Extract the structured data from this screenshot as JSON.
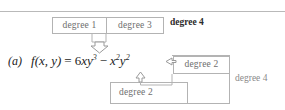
{
  "figure": {
    "label": "(a)",
    "formula": {
      "function_name": "f",
      "args": "(x, y)",
      "equals": "=",
      "term1_coeff": "6",
      "term1_var_x": "x",
      "term1_var_y": "y",
      "term1_y_exp": "3",
      "operator": "−",
      "term2_var_x": "x",
      "term2_x_exp": "2",
      "term2_var_y": "y",
      "term2_y_exp": "2",
      "plain_text": "f(x, y) = 6xy³ − x²y²"
    },
    "annotations": {
      "degree1_box": "degree 1",
      "degree3_box": "degree 3",
      "degree4_top": "degree 4",
      "degree2_right_box": "degree 2",
      "degree2_bottom_box": "degree 2",
      "degree4_right": "degree 4"
    },
    "colors": {
      "box_border": "#b3b3b3",
      "box_text": "#6e6e6e",
      "formula_text": "#1c1c1c",
      "bold_label": "#2b2b2b",
      "muted_label": "#8a8a8a",
      "rule": "#b9b9b9",
      "arrow_stroke": "#9a9a9a",
      "background": "#ffffff"
    }
  }
}
